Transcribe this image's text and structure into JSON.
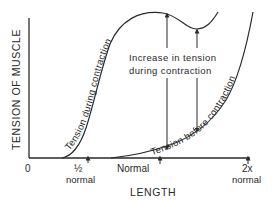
{
  "diagram": {
    "y_axis_label": "TENSION OF MUSCLE",
    "x_axis_label": "LENGTH",
    "origin_label": "0",
    "x_ticks": [
      {
        "top": "½",
        "bottom": "normal"
      },
      {
        "top": "Normal",
        "bottom": ""
      },
      {
        "top": "2x",
        "bottom": "normal"
      }
    ],
    "curves": {
      "during": "Tension during contraction",
      "before": "Tension before contraction"
    },
    "annotation": {
      "line1": "Increase in tension",
      "line2": "during contraction"
    },
    "colors": {
      "ink": "#2a2a2a",
      "background": "#ffffff"
    }
  }
}
